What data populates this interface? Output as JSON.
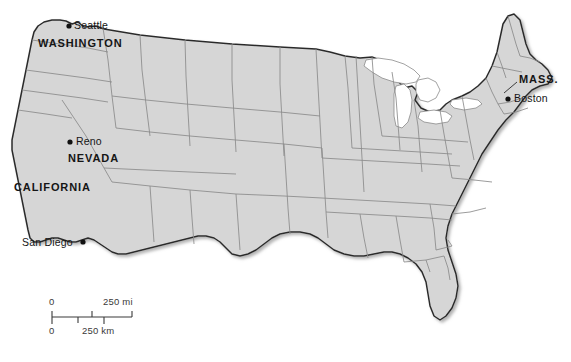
{
  "map": {
    "title": "United States reference map",
    "projection_note": "contiguous United States with state boundaries",
    "colors": {
      "background": "#ffffff",
      "land_fill": "#d6d6d6",
      "state_border": "#8a8a8a",
      "national_border": "#2b2b2b",
      "shadow": "#b8b8b8",
      "label_text": "#151515",
      "scale_text": "#3a3a3a",
      "city_dot": "#111111"
    },
    "state_labels": [
      {
        "id": "washington",
        "text": "WASHINGTON",
        "x": 38,
        "y": 37
      },
      {
        "id": "nevada",
        "text": "NEVADA",
        "x": 68,
        "y": 152
      },
      {
        "id": "california",
        "text": "CALIFORNIA",
        "x": 14,
        "y": 181
      },
      {
        "id": "massachusetts",
        "text": "MASS.",
        "x": 519,
        "y": 80
      }
    ],
    "city_labels": [
      {
        "id": "seattle",
        "text": "Seattle",
        "x": 74,
        "y": 19,
        "dot_x": 69,
        "dot_y": 26
      },
      {
        "id": "reno",
        "text": "Reno",
        "x": 76,
        "y": 135,
        "dot_x": 70,
        "dot_y": 142
      },
      {
        "id": "san-diego",
        "text": "San Diego",
        "x": 22,
        "y": 238,
        "dot_x": 83,
        "dot_y": 242
      },
      {
        "id": "boston",
        "text": "Boston",
        "x": 514,
        "y": 93,
        "dot_x": 508,
        "dot_y": 99
      }
    ],
    "scale": {
      "miles_value": "250",
      "miles_unit": "mi",
      "miles_label": "250 mi",
      "km_value": "250",
      "km_unit": "km",
      "km_label": "250 km",
      "zero_top": "0",
      "zero_bottom": "0"
    }
  }
}
